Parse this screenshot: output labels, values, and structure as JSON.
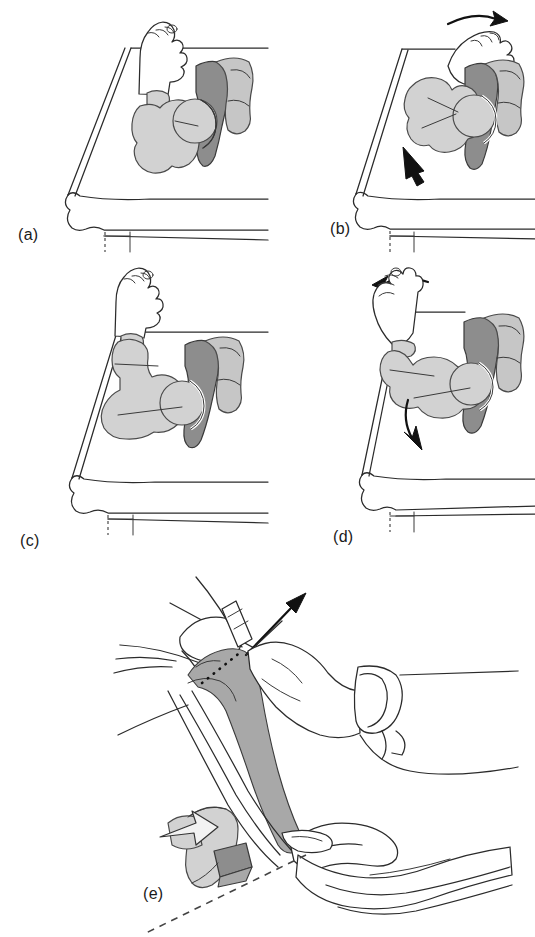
{
  "figure": {
    "panel_count": 5,
    "background_color": "#ffffff",
    "ink_color": "#2b2b2b"
  },
  "palette": {
    "bone_light": "#d2d2d2",
    "bone_mid": "#c6c6c6",
    "bone_dark": "#8d8d8d",
    "bone_shadow": "#a8a8a8",
    "skin_fill": "#ffffff",
    "outline": "#2b2b2b",
    "arrow": "#111111",
    "dashed": "#444444"
  },
  "panels": [
    {
      "id": "a",
      "label": "(a)",
      "caption_text": "(a)",
      "description": "Infant hip and femur resting on examination table, neutral position",
      "arrows": [],
      "elements": [
        "examination-table",
        "mattress",
        "infant-foot",
        "femur-bone",
        "pelvis-bone",
        "acetabulum"
      ]
    },
    {
      "id": "b",
      "label": "(b)",
      "caption_text": "(b)",
      "description": "Femoral head displaced posteriorly; leg rotated with downward pressure",
      "arrows": [
        {
          "name": "rotation-arrow-top",
          "style": "curved",
          "direction": "right"
        },
        {
          "name": "pressure-arrow-lower",
          "style": "straight",
          "direction": "up-left"
        }
      ],
      "elements": [
        "examination-table",
        "mattress",
        "infant-foot",
        "femur-bone",
        "pelvis-bone",
        "acetabulum"
      ]
    },
    {
      "id": "c",
      "label": "(c)",
      "caption_text": "(c)",
      "description": "Hip flexed and abducted; femoral head relocated in acetabulum",
      "arrows": [],
      "elements": [
        "examination-table",
        "mattress",
        "infant-foot",
        "femur-bone",
        "pelvis-bone",
        "acetabulum"
      ]
    },
    {
      "id": "d",
      "label": "(d)",
      "caption_text": "(d)",
      "description": "Leg adducted and rotated back; femoral head dislocates from acetabulum",
      "arrows": [
        {
          "name": "rotation-arrow-top",
          "style": "curved",
          "direction": "left"
        },
        {
          "name": "dislocation-arrow-lower",
          "style": "curved",
          "direction": "down-left"
        }
      ],
      "elements": [
        "examination-table",
        "mattress",
        "infant-foot",
        "femur-bone",
        "pelvis-bone",
        "acetabulum"
      ]
    },
    {
      "id": "e",
      "label": "(e)",
      "caption_text": "(e)",
      "description": "Examiner's two hands grasping the limb; traction arrow and osteotomy plane shown with inset bone cross-section",
      "arrows": [
        {
          "name": "traction-arrow",
          "style": "straight",
          "direction": "up-right"
        },
        {
          "name": "inset-reduction-arrow",
          "style": "block-white",
          "direction": "up-right"
        }
      ],
      "elements": [
        "examiner-upper-hand",
        "examiner-lower-hand",
        "wrist-cuff",
        "limb-bone-shaded",
        "dotted-marker-line",
        "osteotomy-dashed-axis",
        "bone-cross-section-inset"
      ]
    }
  ]
}
